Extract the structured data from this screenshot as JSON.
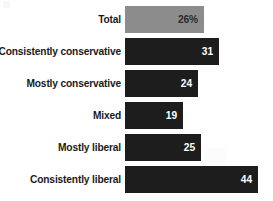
{
  "chart_data": {
    "type": "bar",
    "orientation": "horizontal",
    "title": "",
    "xlabel": "",
    "ylabel": "",
    "grid": false,
    "legend": null,
    "xlim": [
      0,
      50
    ],
    "categories": [
      "Total",
      "Consistently conservative",
      "Mostly conservative",
      "Mixed",
      "Mostly liberal",
      "Consistently liberal"
    ],
    "values": [
      26,
      31,
      24,
      19,
      25,
      44
    ],
    "value_labels": [
      "26%",
      "31",
      "24",
      "19",
      "25",
      "44"
    ],
    "bars": [
      {
        "label": "Total",
        "value": 26,
        "value_label": "26%",
        "color": "#8c8c8c",
        "style": "total"
      },
      {
        "label": "Consistently conservative",
        "value": 31,
        "value_label": "31",
        "color": "#1d1d1d",
        "style": "dark"
      },
      {
        "label": "Mostly conservative",
        "value": 24,
        "value_label": "24",
        "color": "#1d1d1d",
        "style": "dark"
      },
      {
        "label": "Mixed",
        "value": 19,
        "value_label": "19",
        "color": "#1d1d1d",
        "style": "dark"
      },
      {
        "label": "Mostly liberal",
        "value": 25,
        "value_label": "25",
        "color": "#1d1d1d",
        "style": "dark"
      },
      {
        "label": "Consistently liberal",
        "value": 44,
        "value_label": "44",
        "color": "#1d1d1d",
        "style": "dark"
      }
    ],
    "colors": {
      "total_bar": "#8c8c8c",
      "group_bar": "#1d1d1d",
      "label_text": "#1a1a1a",
      "value_text_on_dark": "#ffffff",
      "value_text_on_gray": "#2a2a2a",
      "background": "#ffffff"
    }
  }
}
